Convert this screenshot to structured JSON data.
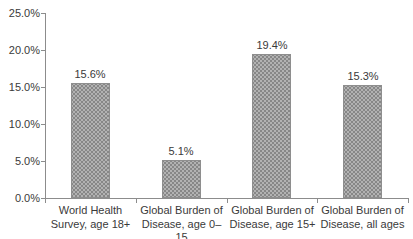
{
  "chart_data": {
    "type": "bar",
    "title": "",
    "xlabel": "",
    "ylabel": "",
    "categories": [
      "World Health\nSurvey, age 18+",
      "Global Burden of\nDisease, age 0–15",
      "Global Burden of\nDisease, age 15+",
      "Global Burden of\nDisease, all ages"
    ],
    "values": [
      15.6,
      5.1,
      19.4,
      15.3
    ],
    "value_labels": [
      "15.6%",
      "5.1%",
      "19.4%",
      "15.3%"
    ],
    "ylim": [
      0,
      25
    ],
    "ytick_values": [
      0,
      5,
      10,
      15,
      20,
      25
    ],
    "ytick_labels": [
      "0.0%",
      "5.0%",
      "10.0%",
      "15.0%",
      "20.0%",
      "25.0%"
    ],
    "grid": false,
    "legend": false,
    "colors": {
      "bar_fill": "#b2b2b2",
      "bar_dot": "#878787",
      "bar_border": "#8e8e8e",
      "axis": "#8c8c8c",
      "text": "#3a3a3a",
      "background": "#ffffff"
    }
  }
}
